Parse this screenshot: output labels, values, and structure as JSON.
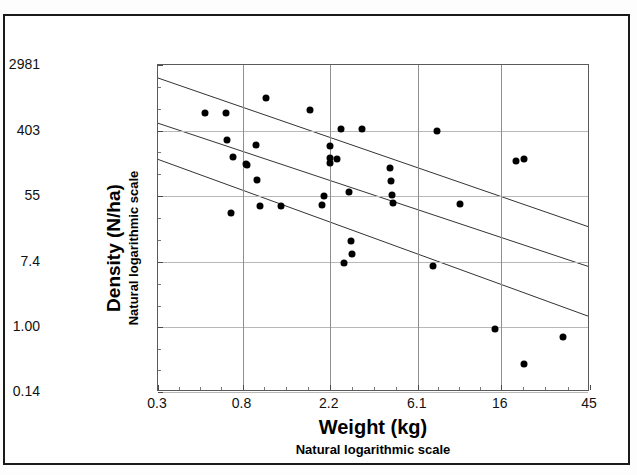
{
  "chart_data": {
    "type": "scatter",
    "title": "",
    "xlabel": "Weight (kg)",
    "xlabel_sub": "Natural logarithmic scale",
    "ylabel": "Density (N/ha)",
    "ylabel_sub": "Natural logarithmic scale",
    "x_scale": "log",
    "y_scale": "log",
    "xlim": [
      0.3,
      45
    ],
    "ylim": [
      0.14,
      2981
    ],
    "xticks": [
      "0.3",
      "0.8",
      "2.2",
      "6.1",
      "16",
      "45"
    ],
    "xtick_values": [
      0.3,
      0.8,
      2.2,
      6.1,
      16,
      45
    ],
    "yticks": [
      "2981",
      "403",
      "55",
      "7.4",
      "1.00",
      "0.14"
    ],
    "ytick_values": [
      2981,
      403,
      55,
      7.4,
      1.0,
      0.14
    ],
    "grid": true,
    "legend": "none",
    "marker": "filled-circle",
    "marker_color": "#000000",
    "points": [
      {
        "x": 0.52,
        "y": 700
      },
      {
        "x": 0.66,
        "y": 690
      },
      {
        "x": 0.67,
        "y": 300
      },
      {
        "x": 0.72,
        "y": 180
      },
      {
        "x": 0.7,
        "y": 33
      },
      {
        "x": 0.83,
        "y": 148
      },
      {
        "x": 0.84,
        "y": 140
      },
      {
        "x": 0.93,
        "y": 260
      },
      {
        "x": 0.95,
        "y": 90
      },
      {
        "x": 0.98,
        "y": 40
      },
      {
        "x": 1.05,
        "y": 1100
      },
      {
        "x": 1.25,
        "y": 40
      },
      {
        "x": 1.75,
        "y": 760
      },
      {
        "x": 2.0,
        "y": 42
      },
      {
        "x": 2.05,
        "y": 55
      },
      {
        "x": 2.2,
        "y": 250
      },
      {
        "x": 2.2,
        "y": 175
      },
      {
        "x": 2.2,
        "y": 150
      },
      {
        "x": 2.4,
        "y": 170
      },
      {
        "x": 2.5,
        "y": 430
      },
      {
        "x": 2.75,
        "y": 62
      },
      {
        "x": 2.8,
        "y": 14
      },
      {
        "x": 2.85,
        "y": 9.5
      },
      {
        "x": 2.6,
        "y": 7.2
      },
      {
        "x": 3.2,
        "y": 430
      },
      {
        "x": 4.4,
        "y": 130
      },
      {
        "x": 4.5,
        "y": 86
      },
      {
        "x": 4.55,
        "y": 57
      },
      {
        "x": 4.6,
        "y": 44
      },
      {
        "x": 7.3,
        "y": 6.5
      },
      {
        "x": 7.6,
        "y": 400
      },
      {
        "x": 10.0,
        "y": 43
      },
      {
        "x": 15.0,
        "y": 0.95
      },
      {
        "x": 19.0,
        "y": 160
      },
      {
        "x": 21.0,
        "y": 170
      },
      {
        "x": 21.0,
        "y": 0.33
      },
      {
        "x": 33.0,
        "y": 0.75
      }
    ],
    "lines": [
      {
        "name": "upper-confidence-band",
        "x0": 0.3,
        "y0": 2000,
        "x1": 45,
        "y1": 21
      },
      {
        "name": "regression-fit",
        "x0": 0.3,
        "y0": 500,
        "x1": 45,
        "y1": 6.2
      },
      {
        "name": "lower-confidence-band",
        "x0": 0.3,
        "y0": 165,
        "x1": 45,
        "y1": 1.35
      }
    ]
  },
  "axes": {
    "y_tick_labels": [
      "2981",
      "403",
      "55",
      "7.4",
      "1.00",
      "0.14"
    ],
    "x_tick_labels": [
      "0.3",
      "0.8",
      "2.2",
      "6.1",
      "16",
      "45"
    ],
    "y_title_main": "Density (N/ha)",
    "y_title_sub": "Natural logarithmic scale",
    "x_title_main": "Weight (kg)",
    "x_title_sub": "Natural logarithmic scale"
  },
  "colors": {
    "frame": "#1a1a1a",
    "grid": "#b8b8b8",
    "marker": "#000000",
    "line": "#333333",
    "background": "#ffffff"
  }
}
